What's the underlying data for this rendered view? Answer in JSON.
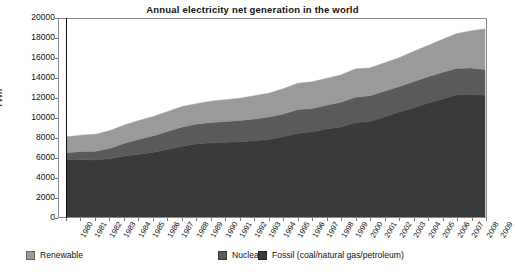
{
  "chart_data": {
    "type": "area",
    "title": "Annual electricity net generation in the world",
    "xlabel": "",
    "ylabel": "TWh",
    "ylim": [
      0,
      20000
    ],
    "ytick_labels": [
      "0",
      "2000",
      "4000",
      "6000",
      "8000",
      "10000",
      "12000",
      "14000",
      "16000",
      "18000",
      "20000"
    ],
    "ytick_values": [
      0,
      2000,
      4000,
      6000,
      8000,
      10000,
      12000,
      14000,
      16000,
      18000,
      20000
    ],
    "grid": false,
    "legend_position": "bottom",
    "stacked": true,
    "stack_order": [
      "Fossil (coal/natural gas/petroleum)",
      "Nuclear",
      "Renewable"
    ],
    "categories": [
      "1980",
      "1981",
      "1982",
      "1983",
      "1984",
      "1985",
      "1986",
      "1987",
      "1988",
      "1989",
      "1990",
      "1991",
      "1992",
      "1993",
      "1994",
      "1995",
      "1996",
      "1997",
      "1998",
      "1999",
      "2000",
      "2001",
      "2002",
      "2003",
      "2004",
      "2005",
      "2006",
      "2007",
      "2008",
      "2009"
    ],
    "series": [
      {
        "name": "Fossil (coal/natural gas/petroleum)",
        "color": "#3a3a3a",
        "values": [
          5800,
          5800,
          5750,
          5900,
          6150,
          6350,
          6550,
          6850,
          7150,
          7400,
          7500,
          7550,
          7600,
          7700,
          7850,
          8100,
          8450,
          8600,
          8900,
          9100,
          9550,
          9650,
          10100,
          10600,
          11000,
          11500,
          11900,
          12350,
          12400,
          12300
        ]
      },
      {
        "name": "Nuclear",
        "color": "#5a5a5a",
        "values": [
          700,
          820,
          900,
          1050,
          1300,
          1500,
          1650,
          1800,
          1950,
          2000,
          2050,
          2100,
          2150,
          2200,
          2250,
          2300,
          2400,
          2350,
          2400,
          2500,
          2550,
          2600,
          2600,
          2550,
          2650,
          2650,
          2700,
          2650,
          2650,
          2600
        ]
      },
      {
        "name": "Renewable",
        "color": "#9a9a9a",
        "values": [
          1600,
          1650,
          1700,
          1800,
          1850,
          1900,
          1950,
          2000,
          2050,
          2050,
          2150,
          2200,
          2250,
          2350,
          2400,
          2550,
          2650,
          2700,
          2700,
          2750,
          2850,
          2800,
          2850,
          2900,
          3050,
          3150,
          3300,
          3500,
          3750,
          4100
        ]
      }
    ]
  },
  "legend": {
    "items": [
      {
        "label": "Renewable",
        "color": "#9a9a9a"
      },
      {
        "label": "Nuclear",
        "color": "#5a5a5a"
      },
      {
        "label": "Fossil (coal/natural gas/petroleum)",
        "color": "#3a3a3a"
      }
    ]
  }
}
